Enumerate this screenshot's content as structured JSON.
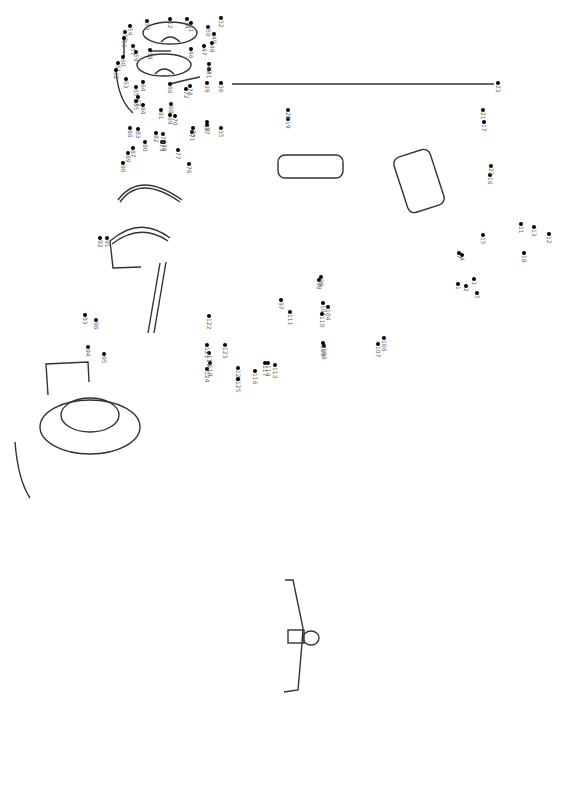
{
  "puzzle": {
    "type": "connect-the-dots",
    "orientation": "rotated-90",
    "line_color": "#333333",
    "dot_color": "#000000",
    "label_color": "#666666",
    "dots": [
      {
        "n": "1",
        "x": 458,
        "y": 284
      },
      {
        "n": "2",
        "x": 466,
        "y": 286
      },
      {
        "n": "3",
        "x": 474,
        "y": 279
      },
      {
        "n": "4",
        "x": 462,
        "y": 255
      },
      {
        "n": "5",
        "x": 477,
        "y": 293
      },
      {
        "n": "7",
        "x": 459,
        "y": 253
      },
      {
        "n": "11",
        "x": 521,
        "y": 224
      },
      {
        "n": "12",
        "x": 549,
        "y": 234
      },
      {
        "n": "13",
        "x": 534,
        "y": 227
      },
      {
        "n": "15",
        "x": 483,
        "y": 235
      },
      {
        "n": "16",
        "x": 490,
        "y": 175
      },
      {
        "n": "17",
        "x": 484,
        "y": 122
      },
      {
        "n": "18",
        "x": 524,
        "y": 253
      },
      {
        "n": "19",
        "x": 288,
        "y": 119
      },
      {
        "n": "20",
        "x": 288,
        "y": 110
      },
      {
        "n": "21",
        "x": 483,
        "y": 110
      },
      {
        "n": "22",
        "x": 491,
        "y": 166
      },
      {
        "n": "23",
        "x": 498,
        "y": 83
      },
      {
        "n": "32",
        "x": 221,
        "y": 18
      },
      {
        "n": "34",
        "x": 187,
        "y": 19
      },
      {
        "n": "35",
        "x": 221,
        "y": 128
      },
      {
        "n": "36",
        "x": 221,
        "y": 83
      },
      {
        "n": "37",
        "x": 207,
        "y": 125
      },
      {
        "n": "38",
        "x": 207,
        "y": 122
      },
      {
        "n": "39",
        "x": 207,
        "y": 83
      },
      {
        "n": "41",
        "x": 209,
        "y": 69
      },
      {
        "n": "42",
        "x": 209,
        "y": 64
      },
      {
        "n": "46",
        "x": 191,
        "y": 49
      },
      {
        "n": "47",
        "x": 204,
        "y": 46
      },
      {
        "n": "48",
        "x": 212,
        "y": 43
      },
      {
        "n": "49",
        "x": 214,
        "y": 34
      },
      {
        "n": "50",
        "x": 208,
        "y": 27
      },
      {
        "n": "51",
        "x": 191,
        "y": 23
      },
      {
        "n": "52",
        "x": 170,
        "y": 19
      },
      {
        "n": "53",
        "x": 147,
        "y": 21
      },
      {
        "n": "54",
        "x": 130,
        "y": 26
      },
      {
        "n": "55",
        "x": 125,
        "y": 32
      },
      {
        "n": "56",
        "x": 124,
        "y": 38
      },
      {
        "n": "57",
        "x": 133,
        "y": 46
      },
      {
        "n": "58",
        "x": 150,
        "y": 50
      },
      {
        "n": "59",
        "x": 136,
        "y": 52
      },
      {
        "n": "60",
        "x": 123,
        "y": 57
      },
      {
        "n": "61",
        "x": 118,
        "y": 63
      },
      {
        "n": "62",
        "x": 116,
        "y": 70
      },
      {
        "n": "63",
        "x": 126,
        "y": 79
      },
      {
        "n": "64",
        "x": 143,
        "y": 82
      },
      {
        "n": "65",
        "x": 136,
        "y": 87
      },
      {
        "n": "66",
        "x": 170,
        "y": 84
      },
      {
        "n": "67",
        "x": 138,
        "y": 97
      },
      {
        "n": "68",
        "x": 171,
        "y": 104
      },
      {
        "n": "69",
        "x": 170,
        "y": 115
      },
      {
        "n": "70",
        "x": 175,
        "y": 116
      },
      {
        "n": "71",
        "x": 192,
        "y": 132
      },
      {
        "n": "72",
        "x": 186,
        "y": 89
      },
      {
        "n": "73",
        "x": 162,
        "y": 142
      },
      {
        "n": "74",
        "x": 190,
        "y": 86
      },
      {
        "n": "75",
        "x": 193,
        "y": 128
      },
      {
        "n": "76",
        "x": 189,
        "y": 164
      },
      {
        "n": "77",
        "x": 178,
        "y": 150
      },
      {
        "n": "78",
        "x": 164,
        "y": 142
      },
      {
        "n": "79",
        "x": 163,
        "y": 134
      },
      {
        "n": "80",
        "x": 145,
        "y": 142
      },
      {
        "n": "81",
        "x": 161,
        "y": 110
      },
      {
        "n": "82",
        "x": 156,
        "y": 133
      },
      {
        "n": "83",
        "x": 138,
        "y": 129
      },
      {
        "n": "84",
        "x": 143,
        "y": 105
      },
      {
        "n": "85",
        "x": 136,
        "y": 101
      },
      {
        "n": "86",
        "x": 130,
        "y": 128
      },
      {
        "n": "87",
        "x": 133,
        "y": 148
      },
      {
        "n": "89",
        "x": 128,
        "y": 153
      },
      {
        "n": "90",
        "x": 123,
        "y": 163
      },
      {
        "n": "91",
        "x": 107,
        "y": 238
      },
      {
        "n": "92",
        "x": 100,
        "y": 238
      },
      {
        "n": "93",
        "x": 85,
        "y": 315
      },
      {
        "n": "94",
        "x": 88,
        "y": 347
      },
      {
        "n": "95",
        "x": 104,
        "y": 354
      },
      {
        "n": "96",
        "x": 96,
        "y": 320
      },
      {
        "n": "97",
        "x": 281,
        "y": 300
      },
      {
        "n": "98",
        "x": 319,
        "y": 280
      },
      {
        "n": "99",
        "x": 321,
        "y": 277
      },
      {
        "n": "101",
        "x": 323,
        "y": 303
      },
      {
        "n": "104",
        "x": 328,
        "y": 307
      },
      {
        "n": "106",
        "x": 384,
        "y": 338
      },
      {
        "n": "107",
        "x": 378,
        "y": 344
      },
      {
        "n": "108",
        "x": 324,
        "y": 346
      },
      {
        "n": "109",
        "x": 323,
        "y": 343
      },
      {
        "n": "110",
        "x": 322,
        "y": 314
      },
      {
        "n": "111",
        "x": 290,
        "y": 312
      },
      {
        "n": "113",
        "x": 275,
        "y": 365
      },
      {
        "n": "114",
        "x": 268,
        "y": 363
      },
      {
        "n": "116",
        "x": 255,
        "y": 371
      },
      {
        "n": "117",
        "x": 265,
        "y": 363
      },
      {
        "n": "118",
        "x": 210,
        "y": 363
      },
      {
        "n": "119",
        "x": 209,
        "y": 353
      },
      {
        "n": "120",
        "x": 238,
        "y": 368
      },
      {
        "n": "121",
        "x": 207,
        "y": 345
      },
      {
        "n": "122",
        "x": 209,
        "y": 316
      },
      {
        "n": "123",
        "x": 225,
        "y": 345
      },
      {
        "n": "124",
        "x": 207,
        "y": 369
      },
      {
        "n": "125",
        "x": 238,
        "y": 379
      }
    ],
    "number_range": [
      1,
      332
    ]
  }
}
